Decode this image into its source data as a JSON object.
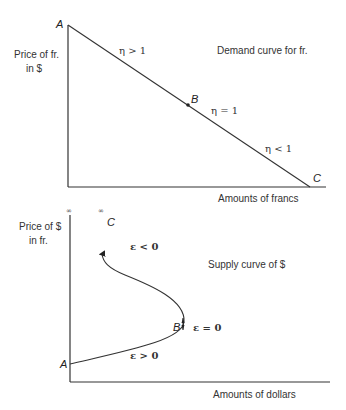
{
  "colors": {
    "line": "#333333",
    "text": "#333333"
  },
  "demand_panel": {
    "title": "Demand curve for fr.",
    "y_axis_label_line1": "Price of fr.",
    "y_axis_label_line2": "in $",
    "x_axis_label": "Amounts of francs",
    "points": {
      "a": "A",
      "b": "B",
      "c": "C"
    },
    "elasticity_labels": {
      "upper": "η > 1",
      "middle": "η = 1",
      "lower": "η < 1"
    }
  },
  "supply_panel": {
    "title": "Supply curve of $",
    "y_axis_label_line1": "Price of $",
    "y_axis_label_line2": "in fr.",
    "x_axis_label": "Amounts of dollars",
    "infinity_axis": "∞",
    "infinity_curve": "∞",
    "points": {
      "a": "A",
      "b": "B",
      "c": "C"
    },
    "elasticity_labels": {
      "upper": "ε < 0",
      "middle": "ε = 0",
      "lower": "ε > 0"
    }
  }
}
